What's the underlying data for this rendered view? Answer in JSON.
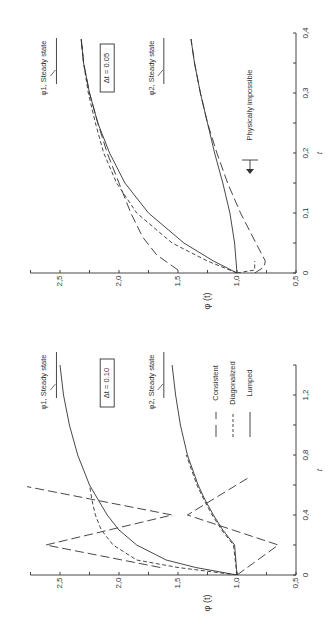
{
  "figure": {
    "rotation": "90deg counter-clockwise (page rotated)",
    "legend": [
      {
        "label": "Consistent",
        "style": "long-dash"
      },
      {
        "label": "Diagonalized",
        "style": "short-dash"
      },
      {
        "label": "Lumped",
        "style": "solid"
      }
    ]
  },
  "chart_data": [
    {
      "type": "line",
      "panel": "top",
      "annotation_box": "Δt = 0.05",
      "xlabel": "t",
      "ylabel": "φ (t)",
      "xlim": [
        0,
        0.4
      ],
      "ylim": [
        0.5,
        2.75
      ],
      "xticks": [
        "0",
        "0.1",
        "0.2",
        "0.3",
        "0.4"
      ],
      "yticks": [
        "0.5",
        "1.0",
        "1.5",
        "2.0",
        "2.5"
      ],
      "annotations": [
        "φ1, Steady state",
        "φ2, Steady state",
        "Physically impossible"
      ],
      "steady_state": {
        "phi1": 2.53,
        "phi2": 1.62
      },
      "series": [
        {
          "name": "Lumped φ1",
          "style": "solid",
          "x": [
            0,
            0.02,
            0.05,
            0.1,
            0.15,
            0.2,
            0.25,
            0.3,
            0.35,
            0.39
          ],
          "y": [
            1.0,
            1.2,
            1.45,
            1.75,
            1.95,
            2.08,
            2.18,
            2.25,
            2.3,
            2.32
          ]
        },
        {
          "name": "Diagonalized φ1",
          "style": "short-dash",
          "x": [
            0,
            0.02,
            0.05,
            0.1,
            0.15,
            0.2,
            0.25,
            0.3,
            0.35,
            0.39
          ],
          "y": [
            1.0,
            1.25,
            1.55,
            1.85,
            2.02,
            2.13,
            2.2,
            2.26,
            2.3,
            2.32
          ]
        },
        {
          "name": "Consistent φ1",
          "style": "long-dash",
          "x": [
            0.005,
            0.03,
            0.06,
            0.1,
            0.15,
            0.2,
            0.25,
            0.3,
            0.35,
            0.39
          ],
          "y": [
            1.5,
            1.68,
            1.8,
            1.9,
            2.0,
            2.1,
            2.18,
            2.25,
            2.3,
            2.32
          ]
        },
        {
          "name": "Lumped φ2",
          "style": "solid",
          "x": [
            0,
            0.05,
            0.1,
            0.15,
            0.2,
            0.25,
            0.3,
            0.35,
            0.39
          ],
          "y": [
            1.0,
            1.02,
            1.06,
            1.12,
            1.19,
            1.25,
            1.31,
            1.36,
            1.39
          ]
        },
        {
          "name": "Diagonalized φ2",
          "style": "short-dash",
          "x": [
            0,
            0.005,
            0.02
          ],
          "y": [
            1.0,
            0.85,
            0.85
          ]
        },
        {
          "name": "Consistent φ2",
          "style": "long-dash",
          "x": [
            0,
            0.01,
            0.02,
            0.05,
            0.1,
            0.15,
            0.2,
            0.25,
            0.3,
            0.35,
            0.39
          ],
          "y": [
            0.85,
            0.77,
            0.76,
            0.84,
            0.97,
            1.08,
            1.17,
            1.25,
            1.31,
            1.36,
            1.39
          ]
        }
      ]
    },
    {
      "type": "line",
      "panel": "bottom",
      "annotation_box": "Δt = 0.10",
      "xlabel": "t",
      "ylabel": "φ (t)",
      "xlim": [
        0,
        1.4
      ],
      "ylim": [
        0.5,
        2.75
      ],
      "xticks": [
        "0",
        "0.4",
        "0.8",
        "1.2"
      ],
      "yticks": [
        "0.5",
        "1.0",
        "1.5",
        "2.0",
        "2.5"
      ],
      "annotations": [
        "φ1, Steady state",
        "φ2, Steady state"
      ],
      "steady_state": {
        "phi1": 2.53,
        "phi2": 1.62
      },
      "series": [
        {
          "name": "Lumped φ1",
          "style": "solid",
          "x": [
            0,
            0.05,
            0.1,
            0.2,
            0.3,
            0.4,
            0.6,
            0.8,
            1.0,
            1.2,
            1.4
          ],
          "y": [
            1.0,
            1.35,
            1.6,
            1.85,
            2.0,
            2.1,
            2.25,
            2.35,
            2.42,
            2.47,
            2.5
          ]
        },
        {
          "name": "Diagonalized φ1",
          "style": "short-dash",
          "x": [
            0,
            0.05,
            0.1,
            0.2,
            0.3,
            0.4,
            0.5,
            0.6
          ],
          "y": [
            1.0,
            1.5,
            1.85,
            2.05,
            2.15,
            2.2,
            2.23,
            2.25
          ]
        },
        {
          "name": "Consistent φ1",
          "style": "long-dash",
          "x": [
            0.05,
            0.2,
            0.4,
            0.6
          ],
          "y": [
            1.65,
            2.62,
            1.55,
            2.85
          ]
        },
        {
          "name": "Lumped φ2",
          "style": "solid",
          "x": [
            0,
            0.2,
            0.3,
            0.4,
            0.5,
            0.6,
            0.8,
            1.0,
            1.2,
            1.4
          ],
          "y": [
            1.0,
            1.02,
            1.12,
            1.2,
            1.27,
            1.33,
            1.42,
            1.48,
            1.52,
            1.55
          ]
        },
        {
          "name": "Diagonalized φ2",
          "style": "short-dash",
          "x": [
            0,
            0.2,
            0.3,
            0.4,
            0.5,
            0.6,
            0.8
          ],
          "y": [
            1.0,
            1.03,
            1.13,
            1.21,
            1.28,
            1.34,
            1.43
          ]
        },
        {
          "name": "Consistent φ2",
          "style": "long-dash",
          "x": [
            0,
            0.2,
            0.4,
            0.65
          ],
          "y": [
            1.0,
            0.65,
            1.42,
            0.9
          ]
        }
      ]
    }
  ]
}
